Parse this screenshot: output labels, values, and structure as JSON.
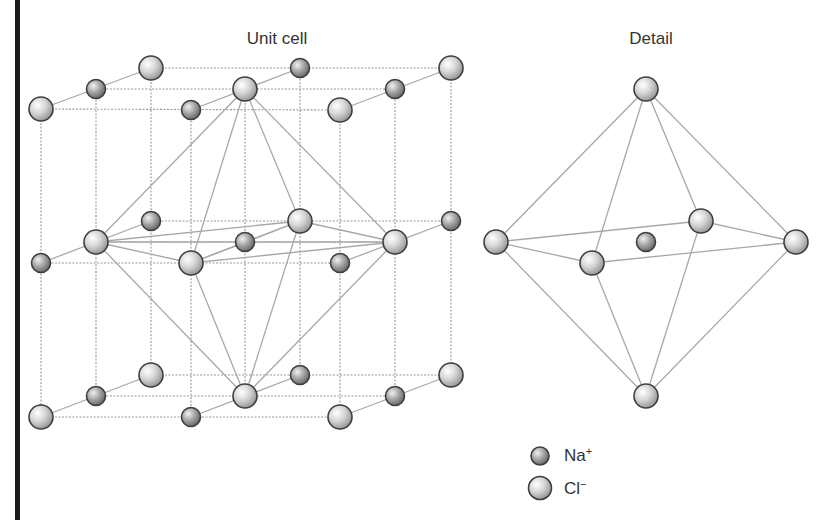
{
  "titles": {
    "unit_cell": "Unit cell",
    "detail": "Detail"
  },
  "legend": {
    "items": [
      {
        "species": "Na",
        "charge": "+",
        "label_base": "Na",
        "label_sup": "+",
        "icon": "sodium-ion-sphere"
      },
      {
        "species": "Cl",
        "charge": "−",
        "label_base": "Cl",
        "label_sup": "−",
        "icon": "chloride-ion-sphere"
      }
    ]
  },
  "colors": {
    "cl_light": "#ffffff",
    "cl_mid": "#d4d4d4",
    "cl_dark": "#8c8c8c",
    "na_light": "#f2f2f2",
    "na_mid": "#aaaaaa",
    "na_dark": "#5e5e5e",
    "outline": "#3e3e3e",
    "line": "#a0a0a0",
    "bar": "#1a1a1a"
  },
  "unit_cell": {
    "layers": [
      {
        "name": "top",
        "atoms": [
          {
            "x": 41,
            "y": 109,
            "t": "Cl"
          },
          {
            "x": 96,
            "y": 89,
            "t": "Na"
          },
          {
            "x": 151,
            "y": 68,
            "t": "Cl"
          },
          {
            "x": 191,
            "y": 110,
            "t": "Na"
          },
          {
            "x": 245,
            "y": 89,
            "t": "Cl"
          },
          {
            "x": 300,
            "y": 68,
            "t": "Na"
          },
          {
            "x": 340,
            "y": 110,
            "t": "Cl"
          },
          {
            "x": 395,
            "y": 89,
            "t": "Na"
          },
          {
            "x": 451,
            "y": 68,
            "t": "Cl"
          }
        ]
      },
      {
        "name": "middle",
        "atoms": [
          {
            "x": 41,
            "y": 263,
            "t": "Na"
          },
          {
            "x": 96,
            "y": 242,
            "t": "Cl"
          },
          {
            "x": 151,
            "y": 221,
            "t": "Na"
          },
          {
            "x": 191,
            "y": 263,
            "t": "Cl"
          },
          {
            "x": 245,
            "y": 242,
            "t": "Na"
          },
          {
            "x": 300,
            "y": 221,
            "t": "Cl"
          },
          {
            "x": 340,
            "y": 263,
            "t": "Na"
          },
          {
            "x": 395,
            "y": 242,
            "t": "Cl"
          },
          {
            "x": 451,
            "y": 221,
            "t": "Na"
          }
        ]
      },
      {
        "name": "bottom",
        "atoms": [
          {
            "x": 41,
            "y": 417,
            "t": "Cl"
          },
          {
            "x": 96,
            "y": 396,
            "t": "Na"
          },
          {
            "x": 151,
            "y": 375,
            "t": "Cl"
          },
          {
            "x": 191,
            "y": 417,
            "t": "Na"
          },
          {
            "x": 245,
            "y": 396,
            "t": "Cl"
          },
          {
            "x": 300,
            "y": 375,
            "t": "Na"
          },
          {
            "x": 340,
            "y": 417,
            "t": "Cl"
          },
          {
            "x": 395,
            "y": 396,
            "t": "Na"
          },
          {
            "x": 451,
            "y": 375,
            "t": "Cl"
          }
        ]
      }
    ],
    "octahedron": {
      "top": {
        "x": 245,
        "y": 89
      },
      "bottom": {
        "x": 245,
        "y": 396
      },
      "equator": [
        {
          "x": 96,
          "y": 242
        },
        {
          "x": 300,
          "y": 221
        },
        {
          "x": 395,
          "y": 242
        },
        {
          "x": 191,
          "y": 263
        }
      ],
      "center": {
        "x": 245,
        "y": 242
      }
    }
  },
  "detail": {
    "top": {
      "x": 646,
      "y": 89,
      "t": "Cl"
    },
    "bottom": {
      "x": 646,
      "y": 396,
      "t": "Cl"
    },
    "equator": [
      {
        "x": 496,
        "y": 242,
        "t": "Cl"
      },
      {
        "x": 701,
        "y": 221,
        "t": "Cl"
      },
      {
        "x": 796,
        "y": 242,
        "t": "Cl"
      },
      {
        "x": 592,
        "y": 263,
        "t": "Cl"
      }
    ],
    "center": {
      "x": 646,
      "y": 242,
      "t": "Na"
    }
  },
  "radii": {
    "Cl": 12,
    "Na": 9.5
  }
}
